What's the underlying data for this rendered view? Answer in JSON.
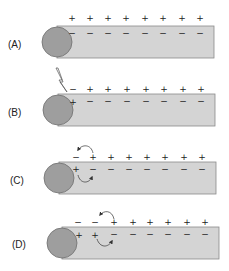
{
  "colors": {
    "axon_fill": "#d4d4d4",
    "axon_stroke": "#8a8a8a",
    "soma_fill": "#9e9e9e",
    "soma_stroke": "#6e6e6e",
    "text": "#222222"
  },
  "charge_x": [
    72,
    90,
    108,
    126,
    145,
    163,
    182,
    200
  ],
  "panels": [
    {
      "label": "(A)",
      "top": 26,
      "outside": [
        "+",
        "+",
        "+",
        "+",
        "+",
        "+",
        "+",
        "+"
      ],
      "inside": [
        "−",
        "−",
        "−",
        "−",
        "−",
        "−",
        "−",
        "−"
      ],
      "stimulus": false,
      "arrows": []
    },
    {
      "label": "(B)",
      "top": 94,
      "outside": [
        "−",
        "+",
        "+",
        "+",
        "+",
        "+",
        "+",
        "+"
      ],
      "inside": [
        "+",
        "−",
        "−",
        "−",
        "−",
        "−",
        "−",
        "−"
      ],
      "stimulus": true,
      "arrows": []
    },
    {
      "label": "(C)",
      "top": 162,
      "outside": [
        "−",
        "+",
        "+",
        "+",
        "+",
        "+",
        "+",
        "+"
      ],
      "inside": [
        "+",
        "−",
        "−",
        "−",
        "−",
        "−",
        "−",
        "−"
      ],
      "stimulus": false,
      "arrows": [
        "top-1-to-0",
        "bottom-0-to-1"
      ]
    },
    {
      "label": "(D)",
      "top": 227,
      "outside": [
        "−",
        "−",
        "+",
        "+",
        "+",
        "+",
        "+",
        "+"
      ],
      "inside": [
        "+",
        "+",
        "−",
        "−",
        "−",
        "−",
        "−",
        "−"
      ],
      "stimulus": false,
      "arrows": [
        "top-2-to-1",
        "bottom-1-to-2"
      ]
    }
  ]
}
